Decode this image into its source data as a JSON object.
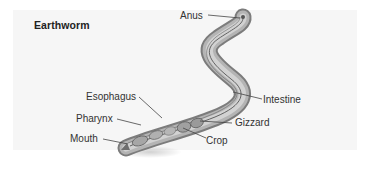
{
  "figure": {
    "title": "Earthworm",
    "labels": {
      "anus": "Anus",
      "intestine": "Intestine",
      "esophagus": "Esophagus",
      "pharynx": "Pharynx",
      "gizzard": "Gizzard",
      "mouth": "Mouth",
      "crop": "Crop"
    },
    "colors": {
      "body_outer": "#8a8a8a",
      "body_mid": "#b9b9b9",
      "body_inner": "#d4d4d4",
      "outline": "#555555",
      "background": "#f6f6f6"
    }
  }
}
